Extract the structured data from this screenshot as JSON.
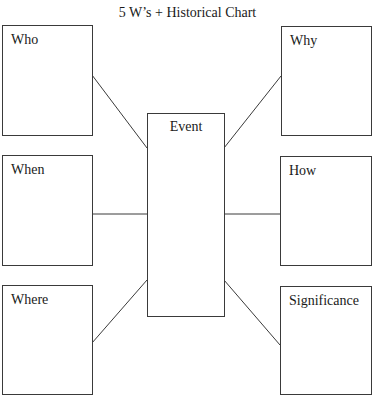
{
  "title": "5 W’s + Historical Chart",
  "center": {
    "label": "Event"
  },
  "boxes": {
    "who": {
      "label": "Who"
    },
    "when": {
      "label": "When"
    },
    "where": {
      "label": "Where"
    },
    "why": {
      "label": "Why"
    },
    "how": {
      "label": "How"
    },
    "significance": {
      "label": "Significance"
    }
  },
  "colors": {
    "stroke": "#3a3a3a",
    "background": "#ffffff",
    "text": "#1a1a1a"
  }
}
